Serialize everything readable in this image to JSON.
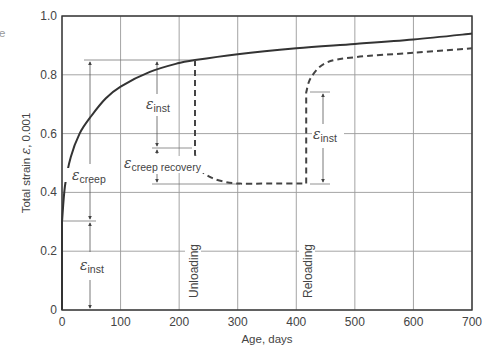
{
  "chart_data": {
    "type": "line",
    "title": "",
    "xlabel": "Age, days",
    "ylabel": "Total strain ε, 0.001",
    "xlim": [
      0,
      700
    ],
    "ylim": [
      0,
      1.0
    ],
    "grid": true,
    "legend": null,
    "x_ticks": [
      "0",
      "100",
      "200",
      "300",
      "400",
      "500",
      "600",
      "700"
    ],
    "y_ticks": [
      "0",
      "0.2",
      "0.4",
      "0.6",
      "0.8",
      "1.0"
    ],
    "series": [
      {
        "name": "Sustained load (solid)",
        "style": "solid",
        "x": [
          0,
          0,
          5,
          15,
          30,
          50,
          75,
          100,
          150,
          200,
          227,
          300,
          400,
          500,
          600,
          700
        ],
        "y": [
          0,
          0.3,
          0.42,
          0.52,
          0.6,
          0.66,
          0.72,
          0.76,
          0.81,
          0.84,
          0.85,
          0.87,
          0.89,
          0.905,
          0.92,
          0.94
        ]
      },
      {
        "name": "Unloading / reloading (dashed)",
        "style": "dashed",
        "x": [
          227,
          227,
          235,
          255,
          280,
          305,
          350,
          417,
          417,
          425,
          450,
          500,
          600,
          700
        ],
        "y": [
          0.85,
          0.53,
          0.48,
          0.45,
          0.435,
          0.43,
          0.43,
          0.43,
          0.74,
          0.79,
          0.84,
          0.86,
          0.875,
          0.89
        ]
      }
    ],
    "annotations": [
      {
        "text": "ε",
        "subscript": "inst",
        "meaning": "initial instantaneous strain",
        "x": 50,
        "range": [
          0,
          0.3
        ]
      },
      {
        "text": "ε",
        "subscript": "creep",
        "meaning": "creep strain",
        "x": 50,
        "range": [
          0.3,
          0.85
        ]
      },
      {
        "text": "ε",
        "subscript": "inst",
        "meaning": "instantaneous recovery on unloading",
        "x": 160,
        "range": [
          0.53,
          0.85
        ]
      },
      {
        "text": "ε",
        "subscript": "creep recovery",
        "meaning": "creep recovery",
        "x": 160,
        "range": [
          0.43,
          0.53
        ]
      },
      {
        "text": "ε",
        "subscript": "inst",
        "meaning": "instantaneous strain on reloading",
        "x": 445,
        "range": [
          0.43,
          0.74
        ]
      },
      {
        "text": "Unloading",
        "orientation": "vertical",
        "x": 227
      },
      {
        "text": "Reloading",
        "orientation": "vertical",
        "x": 417
      }
    ]
  },
  "labels": {
    "x_axis": "Age, days",
    "y_axis_prefix": "Total strain ",
    "y_axis_symbol": "ε",
    "y_axis_suffix": ", 0.001",
    "unloading": "Unloading",
    "reloading": "Reloading",
    "eps": "ε",
    "sub_inst": "inst",
    "sub_creep": "creep",
    "sub_creep_recovery": "creep recovery",
    "edge_fragment": "e"
  }
}
